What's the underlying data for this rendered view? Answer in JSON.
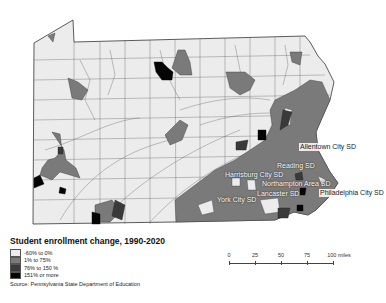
{
  "map": {
    "region": "Pennsylvania",
    "labels": [
      {
        "text": "Allentown City SD",
        "x": 299,
        "y": 143,
        "style": "light"
      },
      {
        "text": "Reading SD",
        "x": 276,
        "y": 162,
        "style": "dark"
      },
      {
        "text": "Harrisburg City SD",
        "x": 224,
        "y": 171,
        "style": "dark"
      },
      {
        "text": "Northampton Area SD",
        "x": 261,
        "y": 180,
        "style": "dark"
      },
      {
        "text": "Lancaster SD",
        "x": 256,
        "y": 190,
        "style": "dark"
      },
      {
        "text": "York City SD",
        "x": 216,
        "y": 196,
        "style": "dark"
      },
      {
        "text": "Philadelphia City SD",
        "x": 319,
        "y": 189,
        "style": "light"
      }
    ]
  },
  "legend": {
    "title": "Student enrollment change, 1990-2020",
    "items": [
      {
        "label": "-60% to 0%",
        "color": "#ececec"
      },
      {
        "label": "1% to 75%",
        "color": "#7a7a7a"
      },
      {
        "label": "76% to 150 %",
        "color": "#3a3a3a"
      },
      {
        "label": "151% or more",
        "color": "#050505"
      }
    ],
    "source": "Source: Pennsylvania State Department of Education"
  },
  "scale_bar": {
    "ticks": [
      "0",
      "25",
      "50",
      "75",
      "100 miles"
    ]
  },
  "colors": {
    "background": "#ffffff",
    "border": "#333333"
  }
}
